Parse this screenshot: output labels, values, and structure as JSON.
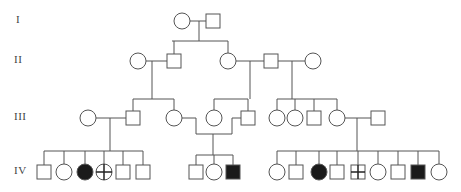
{
  "diagram": {
    "type": "pedigree",
    "colors": {
      "line": "#555555",
      "affected_fill": "#1a1a1a",
      "unaffected_fill": "#ffffff"
    },
    "generations": [
      {
        "label": "I",
        "y": 21
      },
      {
        "label": "II",
        "y": 61
      },
      {
        "label": "III",
        "y": 118
      },
      {
        "label": "IV",
        "y": 172
      }
    ],
    "individuals": [
      {
        "id": "I-1",
        "sex": "female",
        "status": "unaffected",
        "x": 182,
        "y": 21
      },
      {
        "id": "I-2",
        "sex": "male",
        "status": "unaffected",
        "x": 213,
        "y": 21
      },
      {
        "id": "II-1",
        "sex": "female",
        "status": "unaffected",
        "x": 138,
        "y": 61
      },
      {
        "id": "II-2",
        "sex": "male",
        "status": "unaffected",
        "x": 174,
        "y": 61
      },
      {
        "id": "II-3",
        "sex": "female",
        "status": "unaffected",
        "x": 228,
        "y": 61
      },
      {
        "id": "II-4",
        "sex": "male",
        "status": "unaffected",
        "x": 271,
        "y": 61
      },
      {
        "id": "II-5",
        "sex": "female",
        "status": "unaffected",
        "x": 313,
        "y": 61
      },
      {
        "id": "III-1",
        "sex": "female",
        "status": "unaffected",
        "x": 88,
        "y": 118
      },
      {
        "id": "III-2",
        "sex": "male",
        "status": "unaffected",
        "x": 133,
        "y": 118
      },
      {
        "id": "III-3",
        "sex": "female",
        "status": "unaffected",
        "x": 174,
        "y": 118
      },
      {
        "id": "III-4",
        "sex": "female",
        "status": "unaffected",
        "x": 214,
        "y": 118
      },
      {
        "id": "III-5",
        "sex": "male",
        "status": "unaffected",
        "x": 248,
        "y": 118
      },
      {
        "id": "III-6",
        "sex": "female",
        "status": "unaffected",
        "x": 277,
        "y": 118
      },
      {
        "id": "III-7",
        "sex": "female",
        "status": "unaffected",
        "x": 295,
        "y": 118
      },
      {
        "id": "III-8",
        "sex": "male",
        "status": "unaffected",
        "x": 314,
        "y": 118
      },
      {
        "id": "III-9",
        "sex": "female",
        "status": "unaffected",
        "x": 337,
        "y": 118
      },
      {
        "id": "III-10",
        "sex": "male",
        "status": "unaffected",
        "x": 378,
        "y": 118
      },
      {
        "id": "IV-1",
        "sex": "male",
        "status": "unaffected",
        "x": 44,
        "y": 172
      },
      {
        "id": "IV-2",
        "sex": "female",
        "status": "unaffected",
        "x": 64,
        "y": 172
      },
      {
        "id": "IV-3",
        "sex": "female",
        "status": "affected",
        "x": 85,
        "y": 172
      },
      {
        "id": "IV-4",
        "sex": "female",
        "status": "crossed",
        "x": 104,
        "y": 172
      },
      {
        "id": "IV-5",
        "sex": "male",
        "status": "unaffected",
        "x": 123,
        "y": 172
      },
      {
        "id": "IV-6",
        "sex": "male",
        "status": "unaffected",
        "x": 143,
        "y": 172
      },
      {
        "id": "IV-7",
        "sex": "male",
        "status": "unaffected",
        "x": 196,
        "y": 172
      },
      {
        "id": "IV-8",
        "sex": "female",
        "status": "unaffected",
        "x": 214,
        "y": 172
      },
      {
        "id": "IV-9",
        "sex": "male",
        "status": "affected",
        "x": 233,
        "y": 172
      },
      {
        "id": "IV-10",
        "sex": "female",
        "status": "unaffected",
        "x": 277,
        "y": 172
      },
      {
        "id": "IV-11",
        "sex": "male",
        "status": "unaffected",
        "x": 296,
        "y": 172
      },
      {
        "id": "IV-12",
        "sex": "female",
        "status": "affected",
        "x": 319,
        "y": 172
      },
      {
        "id": "IV-13",
        "sex": "male",
        "status": "unaffected",
        "x": 337,
        "y": 172
      },
      {
        "id": "IV-14",
        "sex": "male",
        "status": "crossed",
        "x": 358,
        "y": 172
      },
      {
        "id": "IV-15",
        "sex": "female",
        "status": "unaffected",
        "x": 378,
        "y": 172
      },
      {
        "id": "IV-16",
        "sex": "male",
        "status": "unaffected",
        "x": 398,
        "y": 172
      },
      {
        "id": "IV-17",
        "sex": "male",
        "status": "affected",
        "x": 418,
        "y": 172
      },
      {
        "id": "IV-18",
        "sex": "female",
        "status": "unaffected",
        "x": 439,
        "y": 172
      }
    ],
    "lines": [
      [
        [
          190,
          21
        ],
        [
          206,
          21
        ]
      ],
      [
        [
          199,
          21
        ],
        [
          199,
          41
        ]
      ],
      [
        [
          172,
          41
        ],
        [
          228,
          41
        ]
      ],
      [
        [
          174,
          41
        ],
        [
          174,
          54
        ]
      ],
      [
        [
          228,
          41
        ],
        [
          228,
          53
        ]
      ],
      [
        [
          146,
          61
        ],
        [
          167,
          61
        ]
      ],
      [
        [
          152,
          61
        ],
        [
          152,
          99
        ]
      ],
      [
        [
          133,
          99
        ],
        [
          174,
          99
        ]
      ],
      [
        [
          133,
          99
        ],
        [
          133,
          111
        ]
      ],
      [
        [
          174,
          99
        ],
        [
          174,
          110
        ]
      ],
      [
        [
          236,
          61
        ],
        [
          264,
          61
        ]
      ],
      [
        [
          250,
          61
        ],
        [
          250,
          99
        ]
      ],
      [
        [
          214,
          99
        ],
        [
          248,
          99
        ]
      ],
      [
        [
          214,
          99
        ],
        [
          214,
          110
        ]
      ],
      [
        [
          248,
          99
        ],
        [
          248,
          111
        ]
      ],
      [
        [
          278,
          61
        ],
        [
          305,
          61
        ]
      ],
      [
        [
          292,
          61
        ],
        [
          292,
          99
        ]
      ],
      [
        [
          277,
          99
        ],
        [
          337,
          99
        ]
      ],
      [
        [
          277,
          99
        ],
        [
          277,
          110
        ]
      ],
      [
        [
          295,
          99
        ],
        [
          295,
          110
        ]
      ],
      [
        [
          314,
          99
        ],
        [
          314,
          111
        ]
      ],
      [
        [
          337,
          99
        ],
        [
          337,
          110
        ]
      ],
      [
        [
          96,
          118
        ],
        [
          126,
          118
        ]
      ],
      [
        [
          110,
          118
        ],
        [
          110,
          151
        ]
      ],
      [
        [
          44,
          151
        ],
        [
          143,
          151
        ]
      ],
      [
        [
          44,
          151
        ],
        [
          44,
          165
        ]
      ],
      [
        [
          64,
          151
        ],
        [
          64,
          164
        ]
      ],
      [
        [
          85,
          151
        ],
        [
          85,
          164
        ]
      ],
      [
        [
          104,
          151
        ],
        [
          104,
          164
        ]
      ],
      [
        [
          123,
          151
        ],
        [
          123,
          165
        ]
      ],
      [
        [
          143,
          151
        ],
        [
          143,
          165
        ]
      ],
      [
        [
          182,
          118
        ],
        [
          196,
          118
        ]
      ],
      [
        [
          196,
          118
        ],
        [
          196,
          134
        ]
      ],
      [
        [
          241,
          118
        ],
        [
          232,
          118
        ]
      ],
      [
        [
          232,
          118
        ],
        [
          232,
          134
        ]
      ],
      [
        [
          196,
          134
        ],
        [
          232,
          134
        ]
      ],
      [
        [
          213,
          134
        ],
        [
          213,
          155
        ]
      ],
      [
        [
          196,
          155
        ],
        [
          233,
          155
        ]
      ],
      [
        [
          196,
          155
        ],
        [
          196,
          165
        ]
      ],
      [
        [
          214,
          155
        ],
        [
          214,
          164
        ]
      ],
      [
        [
          233,
          155
        ],
        [
          233,
          165
        ]
      ],
      [
        [
          345,
          118
        ],
        [
          371,
          118
        ]
      ],
      [
        [
          357,
          118
        ],
        [
          357,
          151
        ]
      ],
      [
        [
          277,
          151
        ],
        [
          439,
          151
        ]
      ],
      [
        [
          277,
          151
        ],
        [
          277,
          164
        ]
      ],
      [
        [
          296,
          151
        ],
        [
          296,
          165
        ]
      ],
      [
        [
          319,
          151
        ],
        [
          319,
          164
        ]
      ],
      [
        [
          337,
          151
        ],
        [
          337,
          165
        ]
      ],
      [
        [
          358,
          151
        ],
        [
          358,
          165
        ]
      ],
      [
        [
          378,
          151
        ],
        [
          378,
          164
        ]
      ],
      [
        [
          398,
          151
        ],
        [
          398,
          165
        ]
      ],
      [
        [
          418,
          151
        ],
        [
          418,
          165
        ]
      ],
      [
        [
          439,
          151
        ],
        [
          439,
          164
        ]
      ]
    ]
  }
}
